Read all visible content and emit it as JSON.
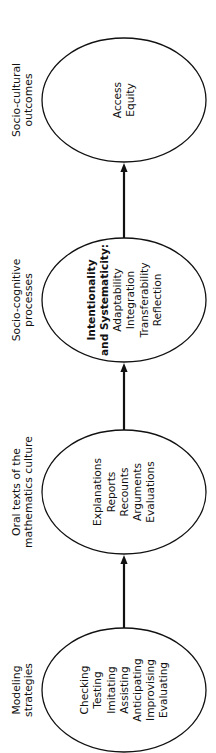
{
  "diagram": {
    "orientation": "rotated-90-ccw",
    "colors": {
      "stroke": "#111111",
      "background": "#ffffff"
    },
    "stages": [
      {
        "label_lines": [
          "Modeling",
          "strategies"
        ],
        "items": [
          {
            "text": "Checking",
            "bold": false
          },
          {
            "text": "Testing",
            "bold": false
          },
          {
            "text": "Imitating",
            "bold": false
          },
          {
            "text": "Assisting",
            "bold": false
          },
          {
            "text": "Anticipating",
            "bold": false
          },
          {
            "text": "Improvising",
            "bold": false
          },
          {
            "text": "Evaluating",
            "bold": false
          }
        ]
      },
      {
        "label_lines": [
          "Oral texts of the",
          "mathematics culture"
        ],
        "items": [
          {
            "text": "Explanations",
            "bold": false
          },
          {
            "text": "Reports",
            "bold": false
          },
          {
            "text": "Recounts",
            "bold": false
          },
          {
            "text": "Arguments",
            "bold": false
          },
          {
            "text": "Evaluations",
            "bold": false
          }
        ]
      },
      {
        "label_lines": [
          "Socio-cognitive",
          "processes"
        ],
        "items": [
          {
            "text": "Intentionality",
            "bold": true
          },
          {
            "text": "and Systematicity:",
            "bold": true
          },
          {
            "text": "Adaptability",
            "bold": false
          },
          {
            "text": "Integration",
            "bold": false
          },
          {
            "text": "Transferability",
            "bold": false
          },
          {
            "text": "Reflection",
            "bold": false
          }
        ]
      },
      {
        "label_lines": [
          "Socio-cultural",
          "outcomes"
        ],
        "items": [
          {
            "text": "Access",
            "bold": false
          },
          {
            "text": "Equity",
            "bold": false
          }
        ]
      }
    ],
    "edges": [
      {
        "from": "Modeling strategies",
        "to": "Oral texts of the mathematics culture"
      },
      {
        "from": "Oral texts of the mathematics culture",
        "to": "Socio-cognitive processes"
      },
      {
        "from": "Socio-cognitive processes",
        "to": "Socio-cultural outcomes"
      }
    ]
  }
}
